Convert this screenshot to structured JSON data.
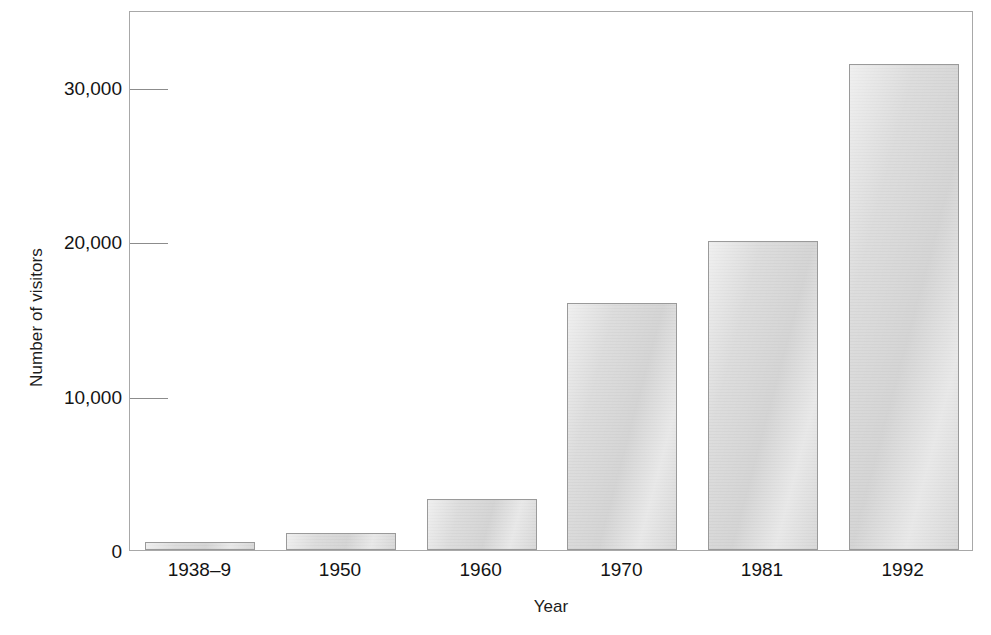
{
  "chart_data": {
    "type": "bar",
    "title": "",
    "subtitle": "",
    "xlabel": "Year",
    "ylabel": "Number of visitors",
    "categories": [
      "1938–9",
      "1950",
      "1960",
      "1970",
      "1981",
      "1992"
    ],
    "values": [
      500,
      1100,
      3300,
      16000,
      20000,
      31500
    ],
    "ylim": [
      0,
      35000
    ],
    "xlim_categories": 6,
    "y_ticks": [
      0,
      10000,
      20000,
      30000
    ],
    "y_tick_labels": [
      "0",
      "10,000",
      "20,000",
      "30,000"
    ],
    "grid": false,
    "legend": null,
    "legend_position": "none",
    "annotations": [],
    "series": [
      {
        "name": "Number of visitors",
        "values": [
          500,
          1100,
          3300,
          16000,
          20000,
          31500
        ]
      }
    ]
  },
  "style": {
    "bar_fill": "#dcdcdc",
    "bar_border": "#9a9a9a",
    "axis_color": "#a8a8a8",
    "tick_color": "#8c8c8c",
    "text_color": "#141414",
    "background": "#ffffff"
  }
}
